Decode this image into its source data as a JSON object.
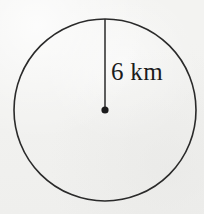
{
  "figure": {
    "type": "circle-with-radius",
    "background_color": "#f3f3f1",
    "stroke_color": "#2a2a2a",
    "text_color": "#1b1b1b",
    "circle": {
      "center_x": 105,
      "center_y": 110,
      "radius_px": 91,
      "stroke_width": 1.6,
      "fill": "none"
    },
    "center_point": {
      "x": 105,
      "y": 110,
      "dot_radius_px": 3.6
    },
    "radius_segment": {
      "from_x": 105,
      "from_y": 110,
      "to_x": 105,
      "to_y": 19,
      "stroke_width": 1.5
    },
    "radius_label": {
      "text": "6 km",
      "value": 6,
      "unit": "km",
      "x": 111,
      "y": 58,
      "font_size_px": 25
    }
  }
}
